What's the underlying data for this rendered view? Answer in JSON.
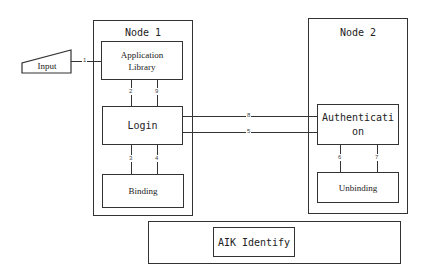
{
  "diagram": {
    "input": {
      "label": "Input"
    },
    "node1": {
      "title": "Node 1",
      "application_library": {
        "line1": "Application",
        "line2": "Library"
      },
      "login": {
        "label": "Login"
      },
      "binding": {
        "label": "Binding"
      }
    },
    "node2": {
      "title": "Node 2",
      "authentication": {
        "line1": "Authenticati",
        "line2": "on"
      },
      "unbinding": {
        "label": "Unbinding"
      }
    },
    "aik": {
      "label": "AIK Identify"
    },
    "connectors": {
      "c1": "1",
      "c2": "2",
      "c9": "9",
      "c3": "3",
      "c4": "4",
      "c8": "8",
      "c5": "5",
      "c6": "6",
      "c7": "7"
    },
    "colors": {
      "line": "#333333",
      "background": "#ffffff",
      "text": "#222222"
    }
  }
}
